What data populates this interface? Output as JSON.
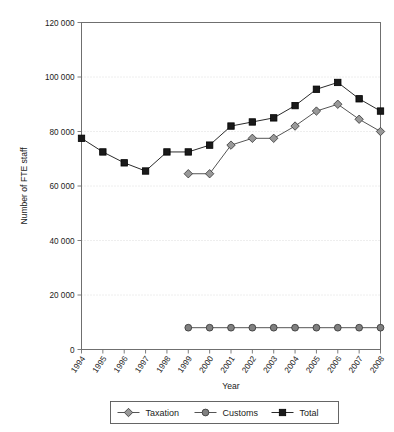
{
  "chart_data": {
    "type": "line",
    "title": "",
    "xlabel": "Year",
    "ylabel": "Number of FTE staff",
    "categories": [
      "1994",
      "1995",
      "1996",
      "1997",
      "1998",
      "1999",
      "2000",
      "2001",
      "2002",
      "2003",
      "2004",
      "2005",
      "2006",
      "2007",
      "2008"
    ],
    "x": [
      1994,
      1995,
      1996,
      1997,
      1998,
      1999,
      2000,
      2001,
      2002,
      2003,
      2004,
      2005,
      2006,
      2007,
      2008
    ],
    "xlim": [
      1994,
      2008
    ],
    "ylim": [
      0,
      120000
    ],
    "ytick_labels": [
      "0",
      "20 000",
      "40 000",
      "60 000",
      "80 000",
      "100 000",
      "120 000"
    ],
    "ytick_values": [
      0,
      20000,
      40000,
      60000,
      80000,
      100000,
      120000
    ],
    "grid": true,
    "legend_position": "bottom",
    "series": [
      {
        "name": "Taxation",
        "marker": "diamond",
        "color": "#999999",
        "values": [
          null,
          null,
          null,
          null,
          null,
          64500,
          64500,
          75000,
          77500,
          77500,
          82000,
          87500,
          90000,
          84500,
          80000
        ]
      },
      {
        "name": "Customs",
        "marker": "circle",
        "color": "#808080",
        "values": [
          null,
          null,
          null,
          null,
          null,
          8000,
          8000,
          8000,
          8000,
          8000,
          8000,
          8000,
          8000,
          8000,
          8000
        ]
      },
      {
        "name": "Total",
        "marker": "square",
        "color": "#1a1a1a",
        "values": [
          77500,
          72500,
          68500,
          65500,
          72500,
          72500,
          75000,
          82000,
          83500,
          85000,
          89500,
          95500,
          98000,
          92000,
          87500
        ]
      }
    ]
  },
  "legend": {
    "items": [
      {
        "label": "Taxation"
      },
      {
        "label": "Customs"
      },
      {
        "label": "Total"
      }
    ]
  },
  "axes": {
    "x_title": "Year",
    "y_title": "Number of FTE staff"
  }
}
